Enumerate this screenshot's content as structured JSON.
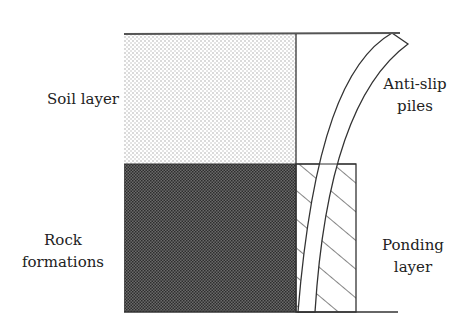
{
  "diagram": {
    "type": "cross-section",
    "labels": {
      "soil_layer": "Soil layer",
      "anti_slip_piles_line1": "Anti-slip",
      "anti_slip_piles_line2": "piles",
      "rock_line1": "Rock",
      "rock_line2": "formations",
      "ponding_line1": "Ponding",
      "ponding_line2": "layer"
    },
    "colors": {
      "line": "#333333",
      "soil_fill": "#e8e8e8",
      "rock_fill": "#4a4a4a",
      "background": "#ffffff"
    }
  }
}
